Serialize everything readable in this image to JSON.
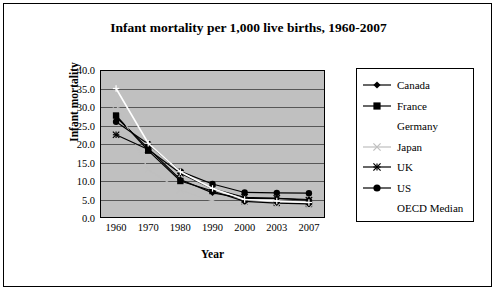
{
  "chart_data": {
    "type": "line",
    "title": "Infant mortality per 1,000 live births, 1960-2007",
    "xlabel": "Year",
    "ylabel": "Infant mortality",
    "categories": [
      "1960",
      "1970",
      "1980",
      "1990",
      "2000",
      "2003",
      "2007"
    ],
    "ylim": [
      0.0,
      40.0
    ],
    "yticks": [
      "0.0",
      "5.0",
      "10.0",
      "15.0",
      "20.0",
      "25.0",
      "30.0",
      "35.0",
      "40.0"
    ],
    "grid": true,
    "legend_position": "right",
    "series": [
      {
        "name": "Canada",
        "marker": "diamond",
        "color": "#000000",
        "values": [
          27.3,
          18.8,
          10.4,
          6.8,
          5.3,
          5.3,
          5.0
        ]
      },
      {
        "name": "France",
        "marker": "square",
        "color": "#000000",
        "values": [
          27.7,
          18.2,
          10.0,
          7.3,
          4.5,
          4.0,
          3.8
        ]
      },
      {
        "name": "Germany",
        "marker": "none",
        "color": "#888888",
        "values": [
          null,
          null,
          null,
          null,
          null,
          null,
          null
        ]
      },
      {
        "name": "Japan",
        "marker": "cross-x",
        "color": "#bfbfbf",
        "values": [
          30.7,
          13.1,
          7.5,
          4.6,
          3.2,
          3.0,
          2.6
        ]
      },
      {
        "name": "UK",
        "marker": "asterisk",
        "color": "#000000",
        "values": [
          22.5,
          18.5,
          12.1,
          7.9,
          5.6,
          5.3,
          4.8
        ]
      },
      {
        "name": "US",
        "marker": "circle",
        "color": "#000000",
        "values": [
          26.0,
          20.0,
          12.6,
          9.2,
          6.9,
          6.8,
          6.7
        ]
      },
      {
        "name": "OECD Median",
        "marker": "plus",
        "color": "#ffffff",
        "values": [
          35.0,
          20.2,
          12.5,
          8.0,
          5.0,
          4.6,
          4.2
        ]
      }
    ]
  },
  "legend": {
    "items": [
      {
        "label": "Canada"
      },
      {
        "label": "France"
      },
      {
        "label": "Germany"
      },
      {
        "label": "Japan"
      },
      {
        "label": "UK"
      },
      {
        "label": "US"
      },
      {
        "label": "OECD Median"
      }
    ]
  }
}
